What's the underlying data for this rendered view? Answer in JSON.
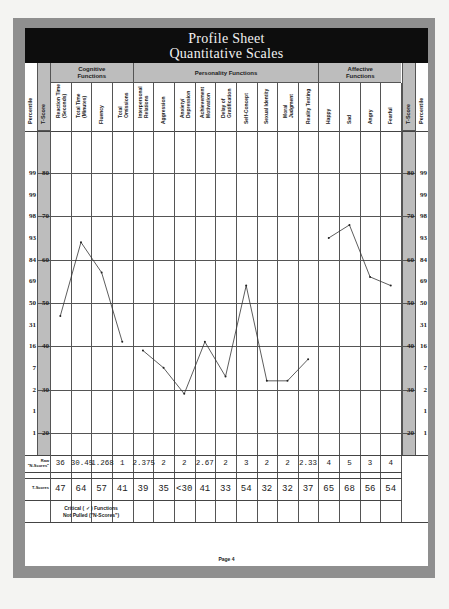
{
  "title": {
    "line1": "Profile Sheet",
    "line2": "Quantitative Scales"
  },
  "groups": [
    {
      "label": "Cognitive\nFunctions",
      "start": 0,
      "span": 4
    },
    {
      "label": "Personality Functions",
      "start": 4,
      "span": 9
    },
    {
      "label": "Affective\nFunctions",
      "start": 13,
      "span": 4
    }
  ],
  "side_columns": {
    "percentile": "Percentile",
    "t_score": "T-Score"
  },
  "scales": [
    {
      "label": "Reaction Time\n(Seconds)",
      "raw": "36",
      "t": "47"
    },
    {
      "label": "Total Time\n(Minutes)",
      "raw": "30.45",
      "t": "64"
    },
    {
      "label": "Fluency",
      "raw": "1.268",
      "t": "57"
    },
    {
      "label": "Total\nOmissions",
      "raw": "1",
      "t": "41"
    },
    {
      "label": "Interpersonal\nRelations",
      "raw": "2.375",
      "t": "39"
    },
    {
      "label": "Aggression",
      "raw": "2",
      "t": "35"
    },
    {
      "label": "Anxiety/\nDepression",
      "raw": "2",
      "t": "<30"
    },
    {
      "label": "Achievement\nMotivation",
      "raw": "2.67",
      "t": "41"
    },
    {
      "label": "Delay of\nGratification",
      "raw": "2",
      "t": "33"
    },
    {
      "label": "Self-Concept",
      "raw": "3",
      "t": "54"
    },
    {
      "label": "Sexual Identity",
      "raw": "2",
      "t": "32"
    },
    {
      "label": "Moral\nJudgment",
      "raw": "2",
      "t": "32"
    },
    {
      "label": "Reality Testing",
      "raw": "2.33",
      "t": "37"
    },
    {
      "label": "Happy",
      "raw": "4",
      "t": "65"
    },
    {
      "label": "Sad",
      "raw": "5",
      "t": "68"
    },
    {
      "label": "Angry",
      "raw": "3",
      "t": "56"
    },
    {
      "label": "Fearful",
      "raw": "4",
      "t": "54"
    }
  ],
  "axis": {
    "t_ticks": [
      "80",
      "70",
      "60",
      "50",
      "40",
      "30",
      "20"
    ],
    "percentile_ticks": [
      "99",
      "99",
      "98",
      "93",
      "84",
      "69",
      "50",
      "31",
      "16",
      "7",
      "2",
      "1",
      "1"
    ]
  },
  "rows": {
    "raw_label": "Raw\n\"N-Scores\"",
    "t_label": "T-Scores",
    "critical_label": "Critical ( ✓ ) Functions\nNot Pulled (\"N-Scores\")"
  },
  "footer": {
    "page": "Page 4"
  },
  "colors": {
    "header_bg": "#0d0d0d",
    "shade": "#bdbdbd",
    "frame": "#8f8f8f",
    "line": "#444444"
  },
  "chart_data": {
    "type": "line",
    "xlabel": "",
    "ylabel": "T-Score",
    "ylim": [
      15,
      90
    ],
    "grid": true,
    "categories": [
      "Reaction Time (Seconds)",
      "Total Time (Minutes)",
      "Fluency",
      "Total Omissions",
      "Interpersonal Relations",
      "Aggression",
      "Anxiety/Depression",
      "Achievement Motivation",
      "Delay of Gratification",
      "Self-Concept",
      "Sexual Identity",
      "Moral Judgment",
      "Reality Testing",
      "Happy",
      "Sad",
      "Angry",
      "Fearful"
    ],
    "series": [
      {
        "name": "Cognitive Functions",
        "x": [
          0,
          1,
          2,
          3
        ],
        "values": [
          47,
          64,
          57,
          41
        ]
      },
      {
        "name": "Personality Functions",
        "x": [
          4,
          5,
          6,
          7,
          8,
          9,
          10,
          11,
          12
        ],
        "values": [
          39,
          35,
          29,
          41,
          33,
          54,
          32,
          32,
          37
        ]
      },
      {
        "name": "Affective Functions",
        "x": [
          13,
          14,
          15,
          16
        ],
        "values": [
          65,
          68,
          56,
          54
        ]
      }
    ],
    "raw_scores": [
      "36",
      "30.45",
      "1.268",
      "1",
      "2.375",
      "2",
      "2",
      "2.67",
      "2",
      "3",
      "2",
      "2",
      "2.33",
      "4",
      "5",
      "3",
      "4"
    ],
    "t_scores_written": [
      "47",
      "64",
      "57",
      "41",
      "39",
      "35",
      "<30",
      "41",
      "33",
      "54",
      "32",
      "32",
      "37",
      "65",
      "68",
      "56",
      "54"
    ],
    "t_score_gridlines": [
      80,
      70,
      60,
      50,
      40,
      30,
      20
    ],
    "percentile_for_t": {
      "80": 99,
      "75": 99,
      "70": 98,
      "65": 93,
      "60": 84,
      "55": 69,
      "50": 50,
      "45": 31,
      "40": 16,
      "35": 7,
      "30": 2,
      "25": 1,
      "20": 1
    }
  }
}
